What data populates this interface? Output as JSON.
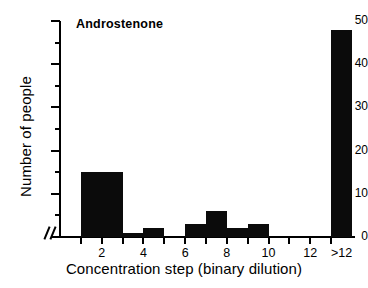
{
  "chart_data": {
    "type": "bar",
    "title": "Androstenone",
    "xlabel": "Concentration step (binary dilution)",
    "ylabel": "Number of people",
    "xlim": [
      0,
      14
    ],
    "ylim": [
      0,
      50
    ],
    "grid": false,
    "legend": null,
    "axis_break": "//",
    "y_ticks_major": [
      0,
      10,
      20,
      30,
      40,
      50
    ],
    "y_ticks_minor": [
      5,
      15,
      25,
      35,
      45
    ],
    "x_tick_positions": [
      1,
      2,
      3,
      4,
      5,
      6,
      7,
      8,
      9,
      10,
      11,
      12,
      13
    ],
    "x_tick_labels": [
      {
        "pos": 2,
        "label": "2"
      },
      {
        "pos": 4,
        "label": "4"
      },
      {
        "pos": 6,
        "label": "6"
      },
      {
        "pos": 8,
        "label": "8"
      },
      {
        "pos": 10,
        "label": "10"
      },
      {
        "pos": 12,
        "label": "12"
      },
      {
        "pos": 13.5,
        "label": ">12"
      }
    ],
    "bar_color": "#0b0b0b",
    "categories": [
      "1-3",
      "3-4",
      "4-5",
      "5-6",
      "6-7",
      "7-8",
      "8-9",
      "9-10",
      "10-11",
      "11-12",
      "12-13",
      ">12"
    ],
    "values": [
      15,
      1,
      2,
      0,
      3,
      6,
      2,
      3,
      0,
      0,
      0,
      48
    ],
    "bars": [
      {
        "x0": 1,
        "x1": 3,
        "value": 15
      },
      {
        "x0": 3,
        "x1": 4,
        "value": 1
      },
      {
        "x0": 4,
        "x1": 5,
        "value": 2
      },
      {
        "x0": 6,
        "x1": 7,
        "value": 3
      },
      {
        "x0": 7,
        "x1": 8,
        "value": 6
      },
      {
        "x0": 8,
        "x1": 9,
        "value": 2
      },
      {
        "x0": 9,
        "x1": 10,
        "value": 3
      },
      {
        "x0": 13,
        "x1": 14,
        "value": 48
      }
    ]
  }
}
